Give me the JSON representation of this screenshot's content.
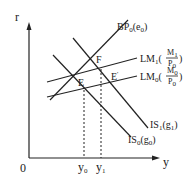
{
  "diagram": {
    "type": "IS-LM-BP",
    "axes": {
      "y_axis_label": "r",
      "x_axis_label": "y",
      "origin_label": "0"
    },
    "x_ticks": [
      {
        "main": "y",
        "sub": "0"
      },
      {
        "main": "y",
        "sub": "1"
      }
    ],
    "points": {
      "E": "E",
      "F": "F",
      "E_prime": "E",
      "E_prime_mark": "'"
    },
    "curves": {
      "bp": {
        "main": "BP",
        "sub": "0",
        "arg": "e",
        "arg_sub": "0"
      },
      "lm1": {
        "main": "LM",
        "sub": "1",
        "num": "M",
        "num_sub": "1",
        "den": "P",
        "den_sub": "0"
      },
      "lm0": {
        "main": "LM",
        "sub": "0",
        "num": "M",
        "num_sub": "0",
        "den": "P",
        "den_sub": "0"
      },
      "is1": {
        "main": "IS",
        "sub": "1",
        "arg": "g",
        "arg_sub": "1"
      },
      "is0": {
        "main": "IS",
        "sub": "0",
        "arg": "g",
        "arg_sub": "0"
      }
    },
    "colors": {
      "line": "#222222",
      "background": "#ffffff"
    }
  }
}
